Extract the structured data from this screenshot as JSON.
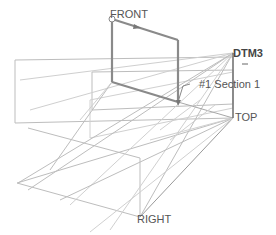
{
  "viewport": {
    "background": "#ffffff",
    "line_color": "#b8b8b8",
    "highlight_color": "#8a8a8a"
  },
  "datums": {
    "front": {
      "label": "FRONT"
    },
    "top": {
      "label": "TOP"
    },
    "right": {
      "label": "RIGHT"
    },
    "dtm3": {
      "label": "DTM3"
    }
  },
  "annotations": {
    "section": {
      "label": "#1 Section 1"
    }
  }
}
